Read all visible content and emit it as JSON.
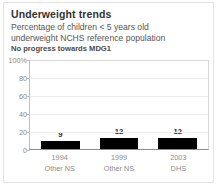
{
  "card": {
    "title": "Underweight trends",
    "subtitle_line1": "Percentage of children < 5 years old",
    "subtitle_line2": "underweight NCHS reference population",
    "note": "No progress towards MDG1"
  },
  "colors": {
    "bar": "#000000",
    "title_text": "#333333",
    "subtitle_text": "#555555",
    "note_text": "#4a4a4a",
    "tick_text": "#888888",
    "axis_line": "#8a8a8a",
    "gridline": "#ededed",
    "card_border": "#e3e3e3"
  },
  "chart_data": {
    "type": "bar",
    "title": "Underweight trends",
    "subtitle": "Percentage of children < 5 years old underweight NCHS reference population",
    "annotations": [
      "No progress towards MDG1"
    ],
    "xlabel": "",
    "ylabel": "",
    "ylim": [
      0,
      100
    ],
    "yticks": [
      0,
      20,
      40,
      60,
      80,
      100
    ],
    "ytick_labels": [
      "0",
      "20",
      "40",
      "60",
      "80",
      "100%"
    ],
    "grid": true,
    "legend": "none",
    "categories": [
      "1994",
      "1999",
      "2003"
    ],
    "sources": [
      "Other NS",
      "Other NS",
      "DHS"
    ],
    "values": [
      9,
      12,
      12
    ],
    "value_labels": [
      "9",
      "12",
      "12"
    ]
  }
}
